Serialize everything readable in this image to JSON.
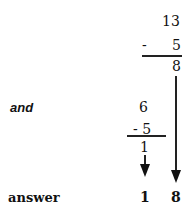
{
  "problem1": {
    "minuend": "13",
    "operator": "-",
    "subtrahend": "5",
    "result": "8"
  },
  "connector": "and",
  "problem2": {
    "minuend": "6",
    "operator_subtrahend": "- 5",
    "result": "1"
  },
  "answer": {
    "label": "answer",
    "digits": [
      "1",
      "8"
    ]
  }
}
